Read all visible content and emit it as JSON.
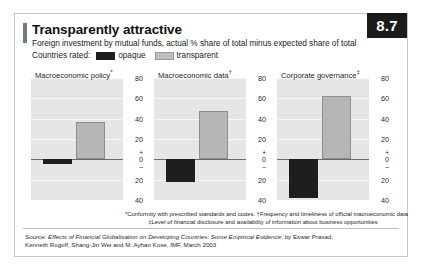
{
  "badge": {
    "number": "8.7"
  },
  "header": {
    "headline": "Transparently attractive",
    "subheadline": "Foreign investment by mutual funds, actual % share of total minus expected share of total"
  },
  "legend": {
    "label": "Countries rated:",
    "items": [
      {
        "name": "opaque",
        "color": "#1e1e1e"
      },
      {
        "name": "transparent",
        "color": "#b6b6b6"
      }
    ]
  },
  "footnotes": {
    "line1": "*Conformity with prescribed standards and codes.   †Frequency and timeliness of official macroeconomic data",
    "line2": "‡Level of financial disclosure and availability of information about business opportunities"
  },
  "source": {
    "prefix": "Source: ",
    "title": "Effects of Financial Globalisation on Developing Countries: Some Empirical Evidence",
    "suffix": ", by Eswar Prasad, Kenneth Rogoff, Shang-Jin Wei and M. Ayhan Kose, IMF, March 2003"
  },
  "axis": {
    "ticks": [
      "80",
      "60",
      "40",
      "20",
      "0",
      "20",
      "40"
    ],
    "plus_sign": "+",
    "minus_sign": "–",
    "ymin": -40,
    "ymax": 80
  },
  "chart_data": {
    "type": "bar",
    "title": "Transparently attractive",
    "subtitle": "Foreign investment by mutual funds, actual % share of total minus expected share of total",
    "xlabel": "",
    "ylabel": "% share of total, actual minus expected",
    "ylim": [
      -40,
      80
    ],
    "yticks": [
      -40,
      -20,
      0,
      20,
      40,
      60,
      80
    ],
    "grid": true,
    "legend_position": "top-left",
    "categories": [
      "opaque",
      "transparent"
    ],
    "panels": [
      {
        "label": "Macroeconomic policy",
        "marker": "*",
        "values": [
          -5,
          37
        ]
      },
      {
        "label": "Macroeconomic data",
        "marker": "†",
        "values": [
          -22,
          48
        ]
      },
      {
        "label": "Corporate governance",
        "marker": "‡",
        "values": [
          -38,
          62
        ]
      }
    ]
  }
}
